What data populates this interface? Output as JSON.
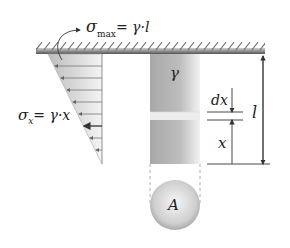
{
  "diagram": {
    "labels": {
      "sigma_max": {
        "symbol": "σ",
        "sub": "max",
        "rhs": "= γ·l"
      },
      "sigma_x": {
        "symbol": "σ",
        "sub": "x",
        "rhs": "= γ·x"
      },
      "gamma": "γ",
      "dx": "dx",
      "x": "x",
      "l": "l",
      "area": "A"
    },
    "colors": {
      "line": "#333333",
      "support_dark": "#555555",
      "bar_dark": "#9a9a9a",
      "bar_light": "#eeeeee",
      "stress_fill": "#dcdcdc"
    }
  }
}
